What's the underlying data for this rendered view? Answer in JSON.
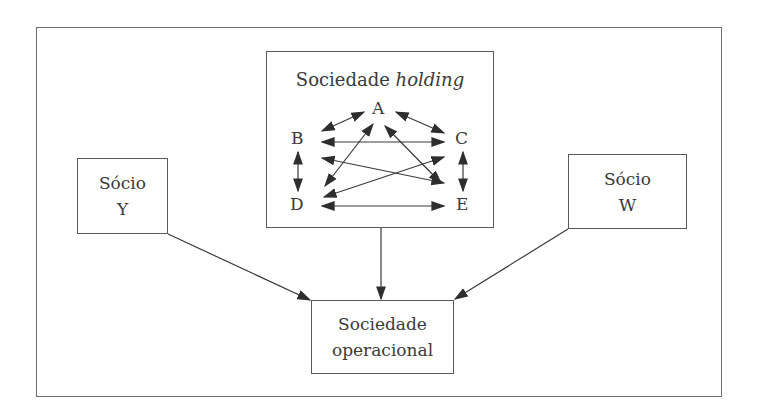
{
  "diagram": {
    "holding": {
      "title_regular": "Sociedade ",
      "title_italic": "holding",
      "nodes": {
        "A": "A",
        "B": "B",
        "C": "C",
        "D": "D",
        "E": "E"
      },
      "relations": [
        [
          "A",
          "B"
        ],
        [
          "A",
          "C"
        ],
        [
          "B",
          "C"
        ],
        [
          "B",
          "D"
        ],
        [
          "C",
          "E"
        ],
        [
          "B",
          "E"
        ],
        [
          "C",
          "D"
        ],
        [
          "A",
          "D"
        ],
        [
          "A",
          "E"
        ],
        [
          "D",
          "E"
        ]
      ]
    },
    "socio_y": {
      "line1": "Sócio",
      "line2": "Y"
    },
    "socio_w": {
      "line1": "Sócio",
      "line2": "W"
    },
    "operacional": {
      "line1": "Sociedade",
      "line2": "operacional"
    },
    "edges": [
      {
        "from": "Sócio Y",
        "to": "Sociedade operacional"
      },
      {
        "from": "Sociedade holding",
        "to": "Sociedade operacional"
      },
      {
        "from": "Sócio W",
        "to": "Sociedade operacional"
      }
    ],
    "colors": {
      "line": "#3a3a3a",
      "border": "#5a5a5a",
      "frame": "#6e6e6e"
    }
  }
}
